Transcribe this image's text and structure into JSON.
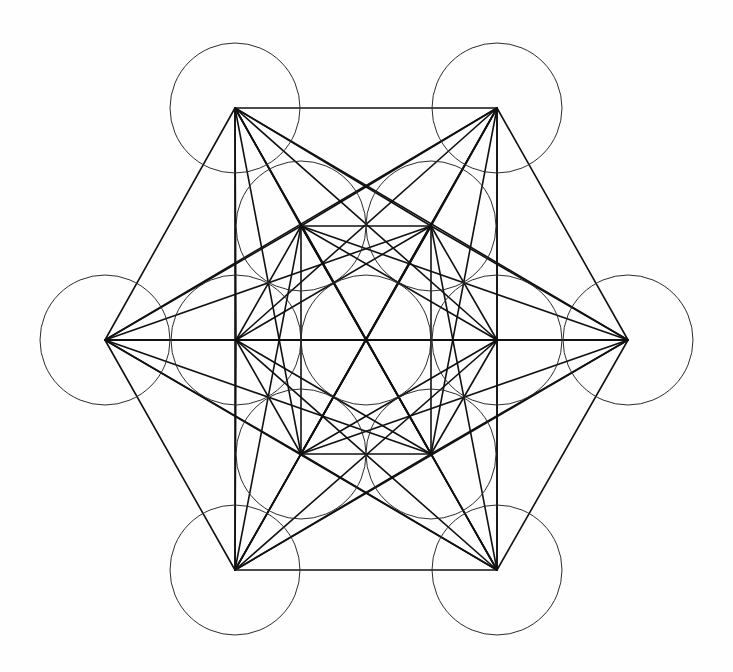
{
  "figure": {
    "canvas": {
      "width": 733,
      "height": 672
    },
    "background_color": "#fefefe",
    "line_color": "#1a1a1a",
    "circle_stroke_color": "#2b2b2b",
    "circle_radius": 65,
    "lattice_spacing": 131,
    "center_point": {
      "x": 366,
      "y": 340
    },
    "node_count": 13,
    "edge_count": 78
  },
  "nodes": [
    {
      "id": "center",
      "label": "center",
      "x": 366,
      "y": 340,
      "ring": "center",
      "r": 65
    },
    {
      "id": "inner-up-left",
      "label": "inner upper-left",
      "x": 301,
      "y": 226,
      "ring": "inner",
      "r": 65
    },
    {
      "id": "inner-up-right",
      "label": "inner upper-right",
      "x": 431,
      "y": 226,
      "ring": "inner",
      "r": 65
    },
    {
      "id": "inner-right",
      "label": "inner right",
      "x": 497,
      "y": 340,
      "ring": "inner",
      "r": 65
    },
    {
      "id": "inner-low-right",
      "label": "inner lower-right",
      "x": 431,
      "y": 454,
      "ring": "inner",
      "r": 65
    },
    {
      "id": "inner-low-left",
      "label": "inner lower-left",
      "x": 301,
      "y": 454,
      "ring": "inner",
      "r": 65
    },
    {
      "id": "inner-left",
      "label": "inner left",
      "x": 236,
      "y": 340,
      "ring": "inner",
      "r": 65
    },
    {
      "id": "outer-up-left",
      "label": "outer upper-left",
      "x": 235,
      "y": 108,
      "ring": "outer",
      "r": 65
    },
    {
      "id": "outer-up-right",
      "label": "outer upper-right",
      "x": 497,
      "y": 108,
      "ring": "outer",
      "r": 65
    },
    {
      "id": "outer-right",
      "label": "outer right",
      "x": 628,
      "y": 340,
      "ring": "outer",
      "r": 65
    },
    {
      "id": "outer-low-right",
      "label": "outer lower-right",
      "x": 497,
      "y": 570,
      "ring": "outer",
      "r": 65
    },
    {
      "id": "outer-low-left",
      "label": "outer lower-left",
      "x": 235,
      "y": 570,
      "ring": "outer",
      "r": 65
    },
    {
      "id": "outer-left",
      "label": "outer left",
      "x": 105,
      "y": 340,
      "ring": "outer",
      "r": 65
    }
  ],
  "chart_data": {
    "type": "scatter",
    "xlabel": "",
    "ylabel": "",
    "xlim": [
      0,
      733
    ],
    "ylim": [
      672,
      0
    ],
    "grid": false,
    "legend": "none",
    "annotations": [
      "13 circles of equal radius 65 px",
      "6 outer circles on hexagon radius 262 px",
      "6 inner circles on hexagon radius 131 px",
      "1 central circle",
      "All 78 center-to-center chords drawn"
    ],
    "series": [
      {
        "name": "circle centers",
        "x": [
          366,
          301,
          431,
          497,
          431,
          301,
          236,
          235,
          497,
          628,
          497,
          235,
          105
        ],
        "y": [
          340,
          226,
          226,
          340,
          454,
          454,
          340,
          108,
          108,
          340,
          570,
          570,
          340
        ]
      }
    ]
  }
}
